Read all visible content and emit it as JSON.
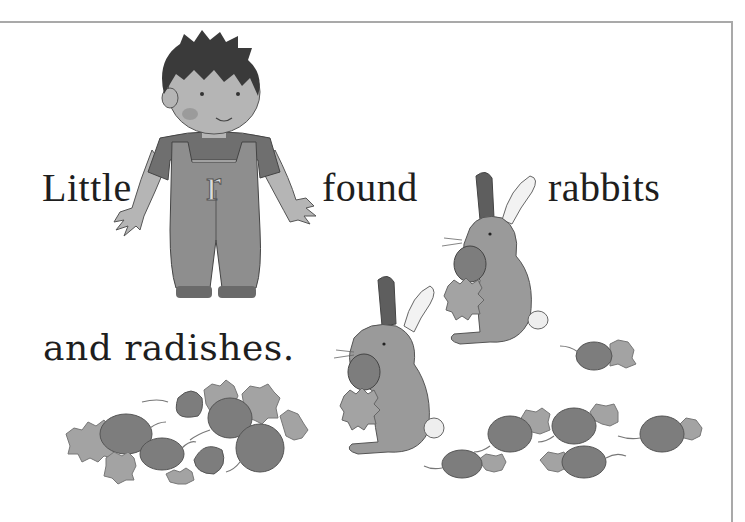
{
  "page": {
    "sentence": {
      "line1": [
        "Little",
        "found",
        "rabbits"
      ],
      "line2": "and radishes."
    },
    "boy": {
      "shirt_letter": "r"
    },
    "colors": {
      "text": "#1e1e1e",
      "frame": "#a9a9a9",
      "hair": "#3a3a3a",
      "skin": "#b5b5b5",
      "overalls": "#8e8e8e",
      "shirt": "#6f6f6f",
      "rabbit_fur": "#9a9a9a",
      "rabbit_ear_inner": "#5e5e5e",
      "radish": "#7d7d7d",
      "radish_leaves": "#a3a3a3"
    }
  }
}
